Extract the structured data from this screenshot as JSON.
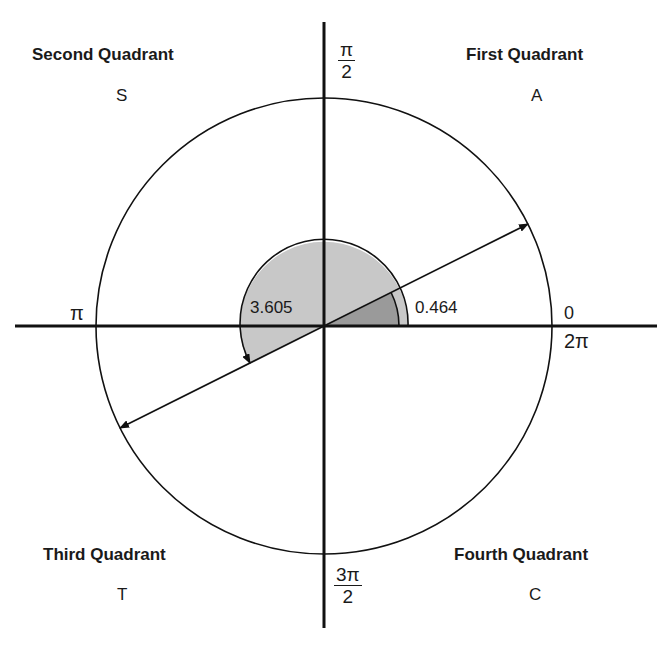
{
  "diagram": {
    "type": "unit-circle-quadrants",
    "center": [
      324,
      326
    ],
    "circle_radius": 228,
    "colors": {
      "line": "#111111",
      "outer_sector_fill": "#c8c8c8",
      "inner_sector_fill": "#9a9a9a",
      "background": "#ffffff"
    },
    "quadrants": [
      {
        "title": "Second Quadrant",
        "letter": "S"
      },
      {
        "title": "First Quadrant",
        "letter": "A"
      },
      {
        "title": "Third Quadrant",
        "letter": "T"
      },
      {
        "title": "Fourth Quadrant",
        "letter": "C"
      }
    ],
    "axis_labels": {
      "top_num": "π",
      "top_den": "2",
      "left": "π",
      "right_top": "0",
      "right_bottom": "2π",
      "bottom_num": "3π",
      "bottom_den": "2"
    },
    "angles": {
      "small": {
        "value_rad": 0.464,
        "label": "0.464"
      },
      "large": {
        "value_rad": 3.605,
        "label": "3.605"
      }
    }
  }
}
